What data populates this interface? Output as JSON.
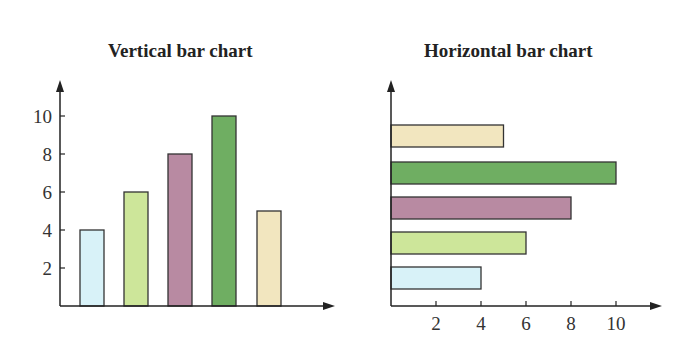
{
  "chart_data": [
    {
      "type": "bar",
      "orientation": "vertical",
      "title": "Vertical bar chart",
      "categories": [
        "1",
        "2",
        "3",
        "4",
        "5"
      ],
      "values": [
        4,
        6,
        8,
        10,
        5
      ],
      "colors": [
        "#d8f2f8",
        "#cde69a",
        "#b88aa2",
        "#6fae62",
        "#f2e6bf"
      ],
      "yticks": [
        2,
        4,
        6,
        8,
        10
      ],
      "xlabel": "",
      "ylabel": "",
      "ylim": [
        0,
        11
      ],
      "grid": false
    },
    {
      "type": "bar",
      "orientation": "horizontal",
      "title": "Horizontal bar chart",
      "categories": [
        "1",
        "2",
        "3",
        "4",
        "5"
      ],
      "values": [
        4,
        6,
        8,
        10,
        5
      ],
      "colors": [
        "#d8f2f8",
        "#cde69a",
        "#b88aa2",
        "#6fae62",
        "#f2e6bf"
      ],
      "xticks": [
        2,
        4,
        6,
        8,
        10
      ],
      "xlabel": "",
      "ylabel": "",
      "xlim": [
        0,
        11
      ],
      "grid": false
    }
  ],
  "titles": {
    "left": "Vertical bar chart",
    "right": "Horizontal bar chart"
  },
  "ticks": {
    "left_y": [
      "2",
      "4",
      "6",
      "8",
      "10"
    ],
    "right_x": [
      "2",
      "4",
      "6",
      "8",
      "10"
    ]
  }
}
